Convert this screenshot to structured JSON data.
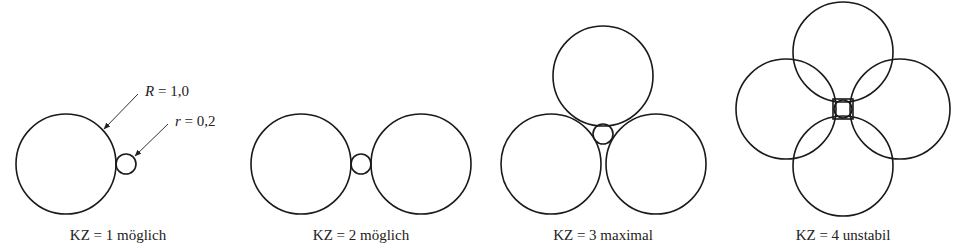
{
  "figure": {
    "annotations": {
      "big_radius": {
        "symbol": "R",
        "equals": " = ",
        "value": "1,0"
      },
      "small_radius": {
        "symbol": "r",
        "equals": " = ",
        "value": "0,2"
      }
    },
    "panels": [
      {
        "caption": "KZ = 1 möglich",
        "coordination_number": 1,
        "large_spheres": 1
      },
      {
        "caption": "KZ = 2 möglich",
        "coordination_number": 2,
        "large_spheres": 2
      },
      {
        "caption": "KZ = 3 maximal",
        "coordination_number": 3,
        "large_spheres": 3
      },
      {
        "caption": "KZ = 4 unstabil",
        "coordination_number": 4,
        "large_spheres": 4
      }
    ]
  }
}
